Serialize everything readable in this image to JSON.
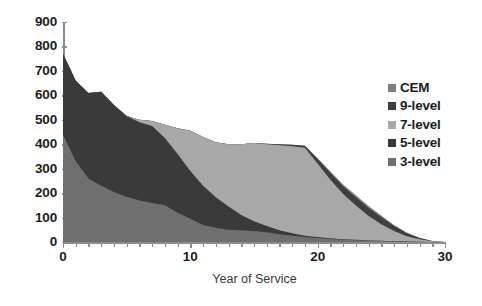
{
  "chart_data": {
    "type": "area",
    "stacked": true,
    "title": "",
    "xlabel": "Year of Service",
    "ylabel": "",
    "xlim": [
      0,
      30
    ],
    "ylim": [
      0,
      900
    ],
    "xticks": [
      0,
      10,
      20,
      30
    ],
    "yticks": [
      0,
      100,
      200,
      300,
      400,
      500,
      600,
      700,
      800,
      900
    ],
    "x_minor_tick_step": 1,
    "grid": false,
    "legend_position": "right",
    "x": [
      0,
      1,
      2,
      3,
      4,
      5,
      6,
      7,
      8,
      9,
      10,
      11,
      12,
      13,
      14,
      15,
      16,
      17,
      18,
      19,
      20,
      21,
      22,
      23,
      24,
      25,
      26,
      27,
      28,
      29,
      30
    ],
    "series": [
      {
        "name": "3-level",
        "color": "#6f6f6f",
        "stack_order": 1,
        "values": [
          440,
          330,
          260,
          230,
          205,
          185,
          170,
          160,
          150,
          120,
          95,
          70,
          58,
          50,
          48,
          45,
          40,
          32,
          26,
          20,
          16,
          12,
          9,
          7,
          5,
          4,
          3,
          2,
          1,
          0,
          0
        ]
      },
      {
        "name": "5-level",
        "color": "#3a3a3a",
        "stack_order": 2,
        "values": [
          330,
          330,
          350,
          385,
          355,
          330,
          320,
          315,
          275,
          240,
          195,
          160,
          125,
          95,
          62,
          40,
          25,
          16,
          10,
          6,
          4,
          3,
          2,
          2,
          1,
          1,
          0,
          0,
          0,
          0,
          0
        ]
      },
      {
        "name": "7-level",
        "color": "#a8a8a8",
        "stack_order": 3,
        "values": [
          0,
          0,
          0,
          0,
          0,
          0,
          10,
          20,
          55,
          105,
          165,
          200,
          225,
          255,
          290,
          320,
          335,
          348,
          356,
          360,
          300,
          240,
          185,
          140,
          100,
          68,
          42,
          22,
          10,
          3,
          0
        ]
      },
      {
        "name": "9-level",
        "color": "#3f3f3f",
        "stack_order": 4,
        "values": [
          0,
          0,
          0,
          0,
          0,
          0,
          0,
          0,
          0,
          0,
          0,
          0,
          0,
          0,
          0,
          0,
          2,
          4,
          6,
          8,
          20,
          28,
          32,
          34,
          33,
          28,
          20,
          12,
          5,
          1,
          0
        ]
      },
      {
        "name": "CEM",
        "color": "#808080",
        "stack_order": 5,
        "values": [
          0,
          0,
          0,
          0,
          0,
          0,
          0,
          0,
          0,
          0,
          0,
          0,
          0,
          0,
          0,
          0,
          0,
          0,
          0,
          0,
          3,
          5,
          7,
          8,
          8,
          7,
          5,
          3,
          1,
          0,
          0
        ]
      }
    ],
    "legend_entries": [
      {
        "label": "CEM",
        "color": "#808080"
      },
      {
        "label": "9-level",
        "color": "#3f3f3f"
      },
      {
        "label": "7-level",
        "color": "#a8a8a8"
      },
      {
        "label": "5-level",
        "color": "#3a3a3a"
      },
      {
        "label": "3-level",
        "color": "#6f6f6f"
      }
    ],
    "axis_color": "#8d8d8d",
    "text_color": "#1d1d1d"
  }
}
